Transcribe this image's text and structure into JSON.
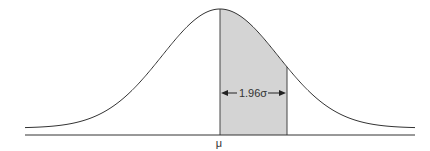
{
  "diagram": {
    "type": "normal-distribution-curve",
    "mean_label": "μ",
    "interval_label": "1.96σ",
    "shaded_region": "mean to mean + 1.96σ",
    "colors": {
      "curve": "#333333",
      "axis": "#333333",
      "shade": "#d4d4d4",
      "background": "#ffffff"
    }
  }
}
